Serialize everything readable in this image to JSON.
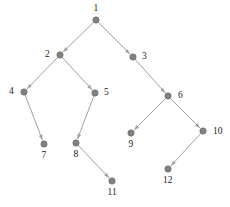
{
  "figure": {
    "type": "directed-tree-graph",
    "width": 230,
    "height": 207,
    "background_color": "#ffffff",
    "node_color": "#808080",
    "node_stroke_color": "#6e6e6e",
    "edge_color": "#a0a0a0",
    "label_color": "#1a1a1a",
    "node_radius": 3.2,
    "edge_width": 1.0
  },
  "chart_data": {
    "type": "diagram",
    "title": "",
    "nodes": [
      {
        "id": "1",
        "label": "1",
        "x": 96,
        "y": 20,
        "label_x": 96,
        "label_y": 9,
        "label_anchor": "center"
      },
      {
        "id": "2",
        "label": "2",
        "x": 60,
        "y": 55,
        "label_x": 50,
        "label_y": 55,
        "label_anchor": "left"
      },
      {
        "id": "3",
        "label": "3",
        "x": 133,
        "y": 57,
        "label_x": 142,
        "label_y": 57,
        "label_anchor": "right"
      },
      {
        "id": "4",
        "label": "4",
        "x": 24,
        "y": 92,
        "label_x": 14,
        "label_y": 92,
        "label_anchor": "left"
      },
      {
        "id": "5",
        "label": "5",
        "x": 95,
        "y": 93,
        "label_x": 104,
        "label_y": 93,
        "label_anchor": "right"
      },
      {
        "id": "6",
        "label": "6",
        "x": 168,
        "y": 96,
        "label_x": 178,
        "label_y": 96,
        "label_anchor": "right"
      },
      {
        "id": "7",
        "label": "7",
        "x": 44,
        "y": 144,
        "label_x": 44,
        "label_y": 156,
        "label_anchor": "below"
      },
      {
        "id": "8",
        "label": "8",
        "x": 76,
        "y": 143,
        "label_x": 76,
        "label_y": 155,
        "label_anchor": "below"
      },
      {
        "id": "9",
        "label": "9",
        "x": 131,
        "y": 133,
        "label_x": 131,
        "label_y": 145,
        "label_anchor": "below"
      },
      {
        "id": "10",
        "label": "10",
        "x": 203,
        "y": 131,
        "label_x": 213,
        "label_y": 132,
        "label_anchor": "right"
      },
      {
        "id": "11",
        "label": "11",
        "x": 112,
        "y": 181,
        "label_x": 112,
        "label_y": 193,
        "label_anchor": "below"
      },
      {
        "id": "12",
        "label": "12",
        "x": 168,
        "y": 169,
        "label_x": 168,
        "label_y": 181,
        "label_anchor": "below"
      }
    ],
    "edges": [
      {
        "from": "1",
        "to": "2",
        "directed": true
      },
      {
        "from": "1",
        "to": "3",
        "directed": true
      },
      {
        "from": "2",
        "to": "4",
        "directed": true
      },
      {
        "from": "2",
        "to": "5",
        "directed": true
      },
      {
        "from": "3",
        "to": "6",
        "directed": true
      },
      {
        "from": "4",
        "to": "7",
        "directed": true
      },
      {
        "from": "5",
        "to": "8",
        "directed": true
      },
      {
        "from": "6",
        "to": "9",
        "directed": true
      },
      {
        "from": "6",
        "to": "10",
        "directed": true
      },
      {
        "from": "8",
        "to": "11",
        "directed": true
      },
      {
        "from": "10",
        "to": "12",
        "directed": true
      }
    ]
  }
}
